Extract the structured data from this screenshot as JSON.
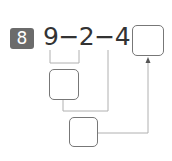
{
  "problem": {
    "number": "8",
    "expression": "9−2−4=",
    "result_box_value": "",
    "step1_box_value": "",
    "step2_box_value": ""
  },
  "colors": {
    "badge": "#6b6b6b",
    "text": "#333333",
    "lines": "#b0b0b0",
    "box_border": "#777777"
  }
}
